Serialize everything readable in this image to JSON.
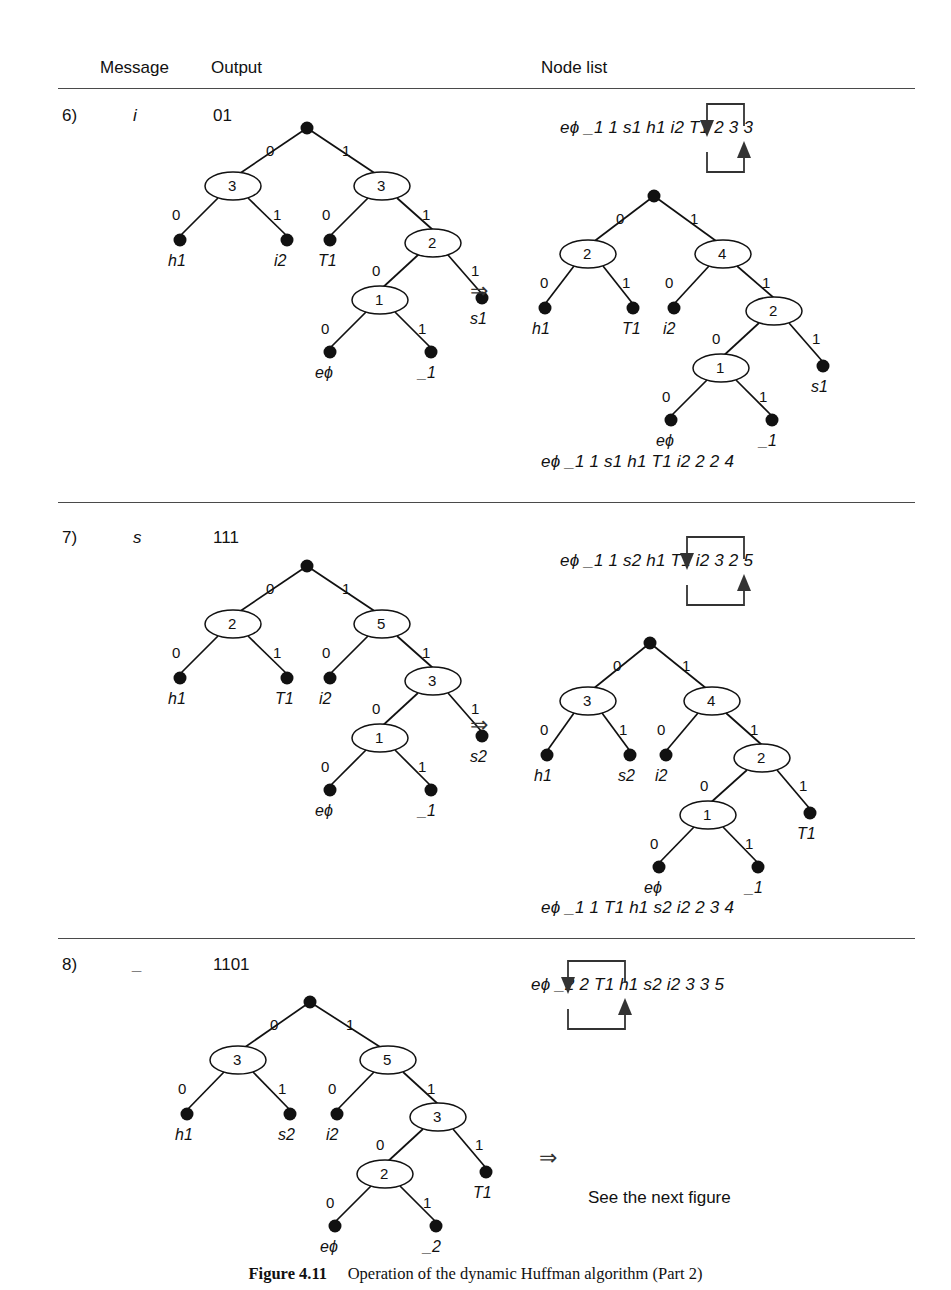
{
  "figure": {
    "caption_label": "Figure 4.11",
    "caption_text": "Operation of the dynamic Huffman algorithm (Part 2)"
  },
  "headers": {
    "message": "Message",
    "output": "Output",
    "node_list": "Node list"
  },
  "symbols": {
    "implies": "⇒",
    "next_figure": "See the next figure"
  },
  "rows": [
    {
      "index": "6)",
      "message": "i",
      "output": "01",
      "node_list_before": "eϕ _1 1 s1 h1 i2 T1 2 3 3",
      "node_list_after": "eϕ _1 1 s1 h1 T1 i2 2 2 4",
      "tree_before": {
        "internal_weights": [
          "3",
          "3",
          "2",
          "1"
        ],
        "leaves": [
          "h1",
          "i2",
          "T1",
          "s1",
          "eϕ",
          "_1"
        ],
        "edge_labels": [
          "0",
          "1",
          "0",
          "1",
          "0",
          "1",
          "0",
          "1",
          "0",
          "1"
        ]
      },
      "tree_after": {
        "internal_weights": [
          "2",
          "4",
          "2",
          "1"
        ],
        "leaves": [
          "h1",
          "T1",
          "i2",
          "s1",
          "eϕ",
          "_1"
        ],
        "edge_labels": [
          "0",
          "1",
          "0",
          "1",
          "0",
          "1",
          "0",
          "1",
          "0",
          "1"
        ]
      }
    },
    {
      "index": "7)",
      "message": "s",
      "output": "111",
      "node_list_before": "eϕ _1 1 s2 h1 T1 i2 3 2 5",
      "node_list_after": "eϕ _1 1 T1 h1 s2 i2 2 3 4",
      "tree_before": {
        "internal_weights": [
          "2",
          "5",
          "3",
          "1"
        ],
        "leaves": [
          "h1",
          "T1",
          "i2",
          "s2",
          "eϕ",
          "_1"
        ],
        "edge_labels": [
          "0",
          "1",
          "0",
          "1",
          "0",
          "1",
          "0",
          "1",
          "0",
          "1"
        ]
      },
      "tree_after": {
        "internal_weights": [
          "3",
          "4",
          "2",
          "1"
        ],
        "leaves": [
          "h1",
          "s2",
          "i2",
          "T1",
          "eϕ",
          "_1"
        ],
        "edge_labels": [
          "0",
          "1",
          "0",
          "1",
          "0",
          "1",
          "0",
          "1",
          "0",
          "1"
        ]
      }
    },
    {
      "index": "8)",
      "message": "_",
      "output": "1101",
      "node_list_before": "eϕ _2 2 T1 h1 s2 i2 3 3 5",
      "node_list_after": "",
      "tree_before": {
        "internal_weights": [
          "3",
          "5",
          "3",
          "2"
        ],
        "leaves": [
          "h1",
          "s2",
          "i2",
          "T1",
          "eϕ",
          "_2"
        ],
        "edge_labels": [
          "0",
          "1",
          "0",
          "1",
          "0",
          "1",
          "0",
          "1",
          "0",
          "1"
        ]
      },
      "tree_after": null
    }
  ]
}
